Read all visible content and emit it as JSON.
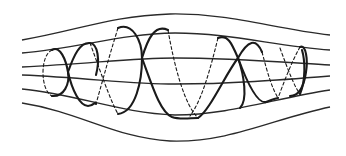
{
  "diagram": {
    "field_lines": {
      "count": 6,
      "color": "#2a2a2a"
    },
    "trajectory": {
      "type": "helix",
      "solid_color": "#1a1a1a",
      "dashed_back_segments": true
    }
  },
  "background": {
    "bleed_through_text": [
      "",
      ""
    ]
  }
}
